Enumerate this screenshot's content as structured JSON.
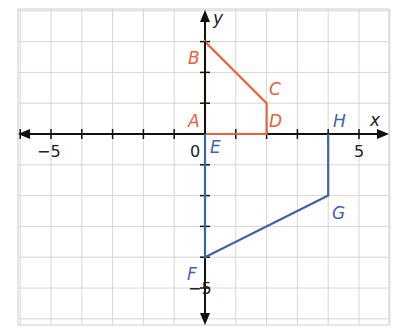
{
  "axes": {
    "x_label": "x",
    "y_label": "y",
    "origin_label": "0",
    "x_ticks": [
      "−5",
      "5"
    ],
    "y_ticks": [
      "−5"
    ]
  },
  "colors": {
    "orange": "#e8623a",
    "blue": "#3f63ad",
    "grid": "#d6d6d6",
    "axis": "#111111"
  },
  "orange_shape": {
    "points": {
      "A": [
        0,
        0
      ],
      "B": [
        0,
        3
      ],
      "C": [
        2,
        1
      ],
      "D": [
        2,
        0
      ]
    },
    "labels": [
      "A",
      "B",
      "C",
      "D"
    ]
  },
  "blue_shape": {
    "points": {
      "E": [
        0,
        0
      ],
      "F": [
        0,
        -4
      ],
      "G": [
        4,
        -2
      ],
      "H": [
        4,
        0
      ]
    },
    "labels": [
      "E",
      "F",
      "G",
      "H"
    ]
  }
}
